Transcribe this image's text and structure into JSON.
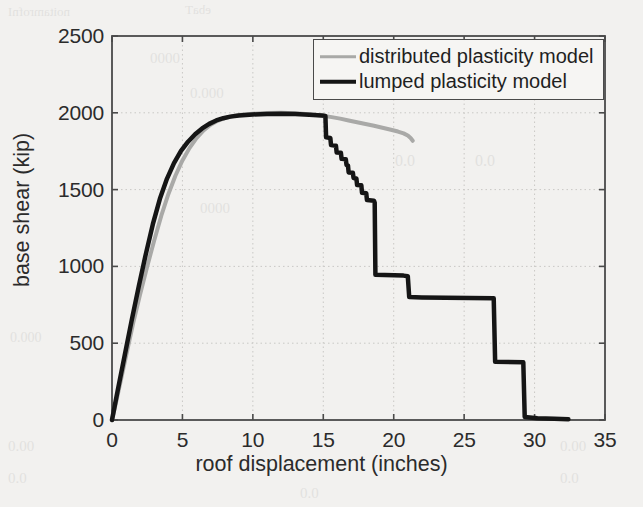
{
  "chart_data": {
    "type": "line",
    "title": "",
    "xlabel": "roof displacement (inches)",
    "ylabel": "base shear (kip)",
    "xlim": [
      0,
      35
    ],
    "ylim": [
      0,
      2500
    ],
    "xticks": [
      0,
      5,
      10,
      15,
      20,
      25,
      30,
      35
    ],
    "yticks": [
      0,
      500,
      1000,
      1500,
      2000,
      2500
    ],
    "grid": true,
    "legend_position": "top-right",
    "colors": {
      "distributed": "#a9a9a7",
      "lumped": "#151515",
      "axis": "#4a4a4a",
      "grid": "#c9c8c5",
      "background": "#f2f1ef",
      "text": "#2b2b2b"
    },
    "series": [
      {
        "name": "distributed plasticity model",
        "color": "#a9a9a7",
        "linewidth": 4,
        "points": [
          [
            0.0,
            0
          ],
          [
            0.3,
            120
          ],
          [
            0.7,
            290
          ],
          [
            1.1,
            460
          ],
          [
            1.5,
            630
          ],
          [
            2.0,
            820
          ],
          [
            2.5,
            1000
          ],
          [
            3.0,
            1170
          ],
          [
            3.5,
            1330
          ],
          [
            4.0,
            1470
          ],
          [
            4.5,
            1590
          ],
          [
            5.0,
            1690
          ],
          [
            5.5,
            1770
          ],
          [
            6.0,
            1835
          ],
          [
            6.5,
            1885
          ],
          [
            7.0,
            1922
          ],
          [
            7.5,
            1948
          ],
          [
            8.0,
            1965
          ],
          [
            8.5,
            1977
          ],
          [
            9.0,
            1985
          ],
          [
            10.0,
            1994
          ],
          [
            11.0,
            1999
          ],
          [
            12.0,
            2000
          ],
          [
            13.0,
            1997
          ],
          [
            14.0,
            1990
          ],
          [
            15.0,
            1981
          ],
          [
            15.6,
            1972
          ],
          [
            16.2,
            1962
          ],
          [
            16.8,
            1950
          ],
          [
            17.4,
            1938
          ],
          [
            18.0,
            1927
          ],
          [
            18.6,
            1916
          ],
          [
            19.2,
            1903
          ],
          [
            19.8,
            1890
          ],
          [
            20.3,
            1878
          ],
          [
            20.7,
            1866
          ],
          [
            21.0,
            1852
          ],
          [
            21.2,
            1836
          ],
          [
            21.35,
            1818
          ]
        ]
      },
      {
        "name": "lumped plasticity model",
        "color": "#151515",
        "linewidth": 4.5,
        "points": [
          [
            0.0,
            0
          ],
          [
            0.4,
            190
          ],
          [
            0.9,
            420
          ],
          [
            1.4,
            650
          ],
          [
            1.9,
            870
          ],
          [
            2.4,
            1080
          ],
          [
            2.9,
            1275
          ],
          [
            3.4,
            1440
          ],
          [
            3.9,
            1570
          ],
          [
            4.4,
            1672
          ],
          [
            4.9,
            1752
          ],
          [
            5.4,
            1812
          ],
          [
            5.9,
            1860
          ],
          [
            6.4,
            1898
          ],
          [
            6.9,
            1928
          ],
          [
            7.4,
            1950
          ],
          [
            7.9,
            1965
          ],
          [
            8.4,
            1975
          ],
          [
            9.0,
            1982
          ],
          [
            10.0,
            1989
          ],
          [
            11.0,
            1993
          ],
          [
            12.0,
            1994
          ],
          [
            13.0,
            1992
          ],
          [
            14.0,
            1988
          ],
          [
            14.9,
            1983
          ],
          [
            15.15,
            1980
          ],
          [
            15.2,
            1840
          ],
          [
            15.5,
            1836
          ],
          [
            15.55,
            1790
          ],
          [
            15.9,
            1786
          ],
          [
            15.95,
            1742
          ],
          [
            16.25,
            1740
          ],
          [
            16.3,
            1700
          ],
          [
            16.6,
            1698
          ],
          [
            16.65,
            1660
          ],
          [
            16.75,
            1658
          ],
          [
            16.8,
            1612
          ],
          [
            17.1,
            1610
          ],
          [
            17.15,
            1575
          ],
          [
            17.35,
            1572
          ],
          [
            17.4,
            1530
          ],
          [
            17.7,
            1528
          ],
          [
            17.75,
            1480
          ],
          [
            18.05,
            1476
          ],
          [
            18.1,
            1432
          ],
          [
            18.6,
            1428
          ],
          [
            18.65,
            1415
          ],
          [
            18.7,
            945
          ],
          [
            20.7,
            940
          ],
          [
            21.0,
            936
          ],
          [
            21.1,
            800
          ],
          [
            22.0,
            798
          ],
          [
            27.1,
            792
          ],
          [
            27.2,
            380
          ],
          [
            29.2,
            376
          ],
          [
            29.3,
            20
          ],
          [
            30.2,
            12
          ],
          [
            31.4,
            8
          ],
          [
            32.4,
            5
          ]
        ]
      }
    ]
  },
  "axes": {
    "y_tick_labels": [
      "0",
      "500",
      "1000",
      "1500",
      "2000",
      "2500"
    ],
    "x_tick_labels": [
      "0",
      "5",
      "10",
      "15",
      "20",
      "25",
      "30",
      "35"
    ],
    "xlabel": "roof displacement (inches)",
    "ylabel": "base shear (kip)"
  },
  "legend": {
    "items": [
      {
        "label": "distributed plasticity model",
        "style": "gray-line"
      },
      {
        "label": "lumped plasticity model",
        "style": "black-line"
      }
    ]
  },
  "bleed_through": {
    "fragments": [
      "noitamrofnI",
      "ebaT",
      "0000",
      "000.0",
      "0.0",
      "0.0",
      "0000",
      "000.0",
      "00.0",
      "0.0",
      "00.0",
      "0.0",
      "0.0"
    ]
  }
}
